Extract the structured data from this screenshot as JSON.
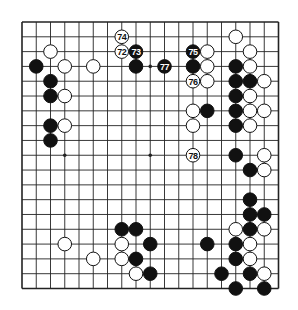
{
  "diagram": {
    "type": "go-board",
    "size": 19,
    "colors": {
      "line": "#222222",
      "black": "#111111",
      "white": "#ffffff",
      "background": "#ffffff"
    },
    "geometry": {
      "left": 22,
      "top": 22,
      "right": 278.5,
      "bottom": 288.5,
      "stone_radius": 6.8
    },
    "star_points": [
      [
        3,
        3
      ],
      [
        9,
        3
      ],
      [
        15,
        3
      ],
      [
        3,
        9
      ],
      [
        9,
        9
      ],
      [
        15,
        9
      ],
      [
        3,
        15
      ],
      [
        9,
        15
      ],
      [
        15,
        15
      ]
    ],
    "stones": [
      {
        "c": "w",
        "x": 2,
        "y": 2
      },
      {
        "c": "b",
        "x": 1,
        "y": 3
      },
      {
        "c": "w",
        "x": 3,
        "y": 3
      },
      {
        "c": "w",
        "x": 5,
        "y": 3
      },
      {
        "c": "b",
        "x": 2,
        "y": 4
      },
      {
        "c": "b",
        "x": 2,
        "y": 5
      },
      {
        "c": "w",
        "x": 3,
        "y": 5
      },
      {
        "c": "b",
        "x": 2,
        "y": 7
      },
      {
        "c": "w",
        "x": 3,
        "y": 7
      },
      {
        "c": "b",
        "x": 2,
        "y": 8
      },
      {
        "c": "b",
        "x": 8,
        "y": 3
      },
      {
        "c": "w",
        "x": 15,
        "y": 1
      },
      {
        "c": "w",
        "x": 13,
        "y": 2
      },
      {
        "c": "w",
        "x": 16,
        "y": 2
      },
      {
        "c": "b",
        "x": 12,
        "y": 3
      },
      {
        "c": "w",
        "x": 13,
        "y": 3
      },
      {
        "c": "b",
        "x": 15,
        "y": 3
      },
      {
        "c": "w",
        "x": 16,
        "y": 3
      },
      {
        "c": "w",
        "x": 13,
        "y": 4
      },
      {
        "c": "b",
        "x": 15,
        "y": 4
      },
      {
        "c": "b",
        "x": 16,
        "y": 4
      },
      {
        "c": "w",
        "x": 17,
        "y": 4
      },
      {
        "c": "b",
        "x": 15,
        "y": 5
      },
      {
        "c": "w",
        "x": 16,
        "y": 5
      },
      {
        "c": "w",
        "x": 12,
        "y": 6
      },
      {
        "c": "b",
        "x": 13,
        "y": 6
      },
      {
        "c": "b",
        "x": 15,
        "y": 6
      },
      {
        "c": "w",
        "x": 16,
        "y": 6
      },
      {
        "c": "w",
        "x": 17,
        "y": 6
      },
      {
        "c": "w",
        "x": 12,
        "y": 7
      },
      {
        "c": "b",
        "x": 15,
        "y": 7
      },
      {
        "c": "w",
        "x": 16,
        "y": 7
      },
      {
        "c": "b",
        "x": 15,
        "y": 9
      },
      {
        "c": "w",
        "x": 17,
        "y": 9
      },
      {
        "c": "b",
        "x": 16,
        "y": 10
      },
      {
        "c": "w",
        "x": 17,
        "y": 10
      },
      {
        "c": "b",
        "x": 16,
        "y": 12
      },
      {
        "c": "b",
        "x": 16,
        "y": 13
      },
      {
        "c": "b",
        "x": 17,
        "y": 13
      },
      {
        "c": "w",
        "x": 15,
        "y": 14
      },
      {
        "c": "b",
        "x": 16,
        "y": 14
      },
      {
        "c": "w",
        "x": 17,
        "y": 14
      },
      {
        "c": "b",
        "x": 13,
        "y": 15
      },
      {
        "c": "b",
        "x": 15,
        "y": 15
      },
      {
        "c": "w",
        "x": 16,
        "y": 15
      },
      {
        "c": "b",
        "x": 15,
        "y": 16
      },
      {
        "c": "w",
        "x": 16,
        "y": 16
      },
      {
        "c": "b",
        "x": 14,
        "y": 17
      },
      {
        "c": "b",
        "x": 16,
        "y": 17
      },
      {
        "c": "w",
        "x": 17,
        "y": 17
      },
      {
        "c": "b",
        "x": 15,
        "y": 18
      },
      {
        "c": "b",
        "x": 17,
        "y": 18
      },
      {
        "c": "b",
        "x": 7,
        "y": 14
      },
      {
        "c": "b",
        "x": 8,
        "y": 14
      },
      {
        "c": "w",
        "x": 3,
        "y": 15
      },
      {
        "c": "w",
        "x": 7,
        "y": 15
      },
      {
        "c": "b",
        "x": 9,
        "y": 15
      },
      {
        "c": "w",
        "x": 5,
        "y": 16
      },
      {
        "c": "w",
        "x": 7,
        "y": 16
      },
      {
        "c": "b",
        "x": 8,
        "y": 16
      },
      {
        "c": "w",
        "x": 8,
        "y": 17
      },
      {
        "c": "b",
        "x": 9,
        "y": 17
      }
    ],
    "numbered_moves": [
      {
        "n": "72",
        "c": "w",
        "x": 7,
        "y": 2
      },
      {
        "n": "73",
        "c": "b",
        "x": 8,
        "y": 2
      },
      {
        "n": "74",
        "c": "w",
        "x": 7,
        "y": 1
      },
      {
        "n": "75",
        "c": "b",
        "x": 12,
        "y": 2
      },
      {
        "n": "76",
        "c": "w",
        "x": 12,
        "y": 4
      },
      {
        "n": "77",
        "c": "b",
        "x": 10,
        "y": 3
      },
      {
        "n": "78",
        "c": "w",
        "x": 12,
        "y": 9
      }
    ]
  }
}
